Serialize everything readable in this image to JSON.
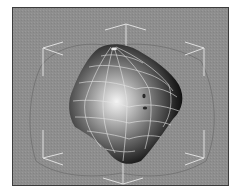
{
  "viewport": {
    "name": "3d-perspective-viewport",
    "background_color": "#8e8e8e",
    "border_color": "#3c3c3c"
  },
  "object": {
    "type": "deformed-sphere-mesh",
    "shading": "smooth-shaded-with-wireframe",
    "wireframe_color": "#e6e6e6",
    "highlight_color": "#f2f2f2",
    "shadow_color": "#0a0a0a"
  },
  "bounding_box": {
    "color": "#e0e0e0"
  }
}
